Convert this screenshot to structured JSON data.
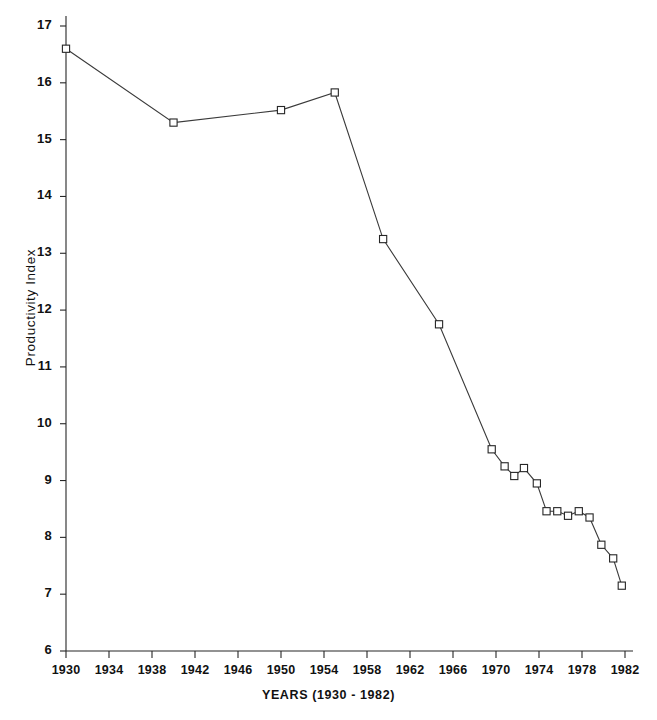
{
  "chart_data": {
    "type": "line",
    "title": "",
    "xlabel": "YEARS (1930 - 1982)",
    "ylabel": "Productivity Index",
    "xlim": [
      1930,
      1982
    ],
    "ylim": [
      6,
      17
    ],
    "grid": false,
    "legend": null,
    "x_ticks": [
      1930,
      1934,
      1938,
      1942,
      1946,
      1950,
      1954,
      1958,
      1962,
      1966,
      1970,
      1974,
      1978,
      1982
    ],
    "y_ticks": [
      6,
      7,
      8,
      9,
      10,
      11,
      12,
      13,
      14,
      15,
      16,
      17
    ],
    "marker": "square-open",
    "series": [
      {
        "name": "Productivity Index",
        "points": [
          {
            "x": 1930,
            "y": 16.6
          },
          {
            "x": 1940,
            "y": 15.3
          },
          {
            "x": 1950,
            "y": 15.52
          },
          {
            "x": 1955,
            "y": 15.83
          },
          {
            "x": 1959.5,
            "y": 13.25
          },
          {
            "x": 1964.7,
            "y": 11.75
          },
          {
            "x": 1969.6,
            "y": 9.55
          },
          {
            "x": 1970.8,
            "y": 9.25
          },
          {
            "x": 1971.7,
            "y": 9.08
          },
          {
            "x": 1972.6,
            "y": 9.22
          },
          {
            "x": 1973.8,
            "y": 8.95
          },
          {
            "x": 1974.7,
            "y": 8.46
          },
          {
            "x": 1975.7,
            "y": 8.46
          },
          {
            "x": 1976.7,
            "y": 8.38
          },
          {
            "x": 1977.7,
            "y": 8.46
          },
          {
            "x": 1978.7,
            "y": 8.35
          },
          {
            "x": 1979.8,
            "y": 7.87
          },
          {
            "x": 1980.9,
            "y": 7.63
          },
          {
            "x": 1981.7,
            "y": 7.15
          }
        ]
      }
    ]
  },
  "axes": {
    "x_tick_labels": [
      "1930",
      "1934",
      "1938",
      "1942",
      "1946",
      "1950",
      "1954",
      "1958",
      "1962",
      "1966",
      "1970",
      "1974",
      "1978",
      "1982"
    ],
    "y_tick_labels": [
      "17",
      "16",
      "15",
      "14",
      "13",
      "12",
      "11",
      "10",
      "9",
      "8",
      "7",
      "6"
    ],
    "x_axis_title": "YEARS (1930 - 1982)",
    "y_axis_title": "Productivity Index"
  },
  "style": {
    "line_color": "#3a3a3a",
    "marker_fill": "#ffffff",
    "marker_stroke": "#262626",
    "axis_color": "#262626",
    "background": "#ffffff",
    "text_color": "#111111"
  }
}
